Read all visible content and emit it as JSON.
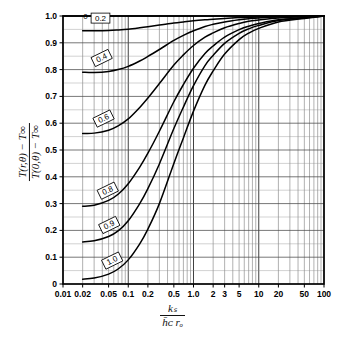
{
  "figure": {
    "title": "",
    "axis_y_label_numerator": "T(r,θ) − T∞",
    "axis_y_label_denominator": "T(0,θ) − T∞",
    "axis_x_label_numerator": "kₛ",
    "axis_x_label_denominator": "h̄ᴄ rₒ"
  },
  "chart_data": {
    "type": "line",
    "title": "",
    "xlabel": "k_s / (h_c r_o)",
    "ylabel": "(T(r,θ) - T∞) / (T(0,θ) - T∞)",
    "xscale": "log",
    "yscale": "linear",
    "xlim": [
      0.01,
      100
    ],
    "ylim": [
      0,
      1.0
    ],
    "grid": true,
    "legend": "inline-curve-labels",
    "x_ticks": [
      {
        "value": 0.01,
        "label": "0.01"
      },
      {
        "value": 0.02,
        "label": "0.02"
      },
      {
        "value": 0.05,
        "label": "0.05"
      },
      {
        "value": 0.1,
        "label": "0.1"
      },
      {
        "value": 0.2,
        "label": "0.2"
      },
      {
        "value": 0.5,
        "label": "0.5"
      },
      {
        "value": 1.0,
        "label": "1.0"
      },
      {
        "value": 2,
        "label": "2"
      },
      {
        "value": 3,
        "label": "3"
      },
      {
        "value": 5,
        "label": "5"
      },
      {
        "value": 10,
        "label": "10"
      },
      {
        "value": 20,
        "label": "20"
      },
      {
        "value": 50,
        "label": "50"
      },
      {
        "value": 100,
        "label": "100"
      }
    ],
    "y_ticks": [
      {
        "value": 0.0,
        "label": "0"
      },
      {
        "value": 0.1,
        "label": "0.1"
      },
      {
        "value": 0.2,
        "label": "0.2"
      },
      {
        "value": 0.3,
        "label": "0.3"
      },
      {
        "value": 0.4,
        "label": "0.4"
      },
      {
        "value": 0.5,
        "label": "0.5"
      },
      {
        "value": 0.6,
        "label": "0.6"
      },
      {
        "value": 0.7,
        "label": "0.7"
      },
      {
        "value": 0.8,
        "label": "0.8"
      },
      {
        "value": 0.9,
        "label": "0.9"
      },
      {
        "value": 1.0,
        "label": "1.0"
      }
    ],
    "series": [
      {
        "name": "0",
        "label": "0",
        "label_x": 0.0205,
        "label_y": 1.035,
        "x": [
          0.01,
          0.02,
          0.05,
          0.1,
          0.2,
          0.5,
          1.0,
          2,
          5,
          10,
          20,
          50,
          100
        ],
        "values": [
          1.0,
          1.0,
          1.0,
          1.0,
          1.0,
          1.0,
          1.0,
          1.0,
          1.0,
          1.0,
          1.0,
          1.0,
          1.0
        ]
      },
      {
        "name": "0.2",
        "label": "0.2",
        "label_x": 0.027,
        "label_y": 0.992,
        "x": [
          0.02,
          0.03,
          0.05,
          0.07,
          0.1,
          0.15,
          0.2,
          0.3,
          0.5,
          0.7,
          1.0,
          1.5,
          2,
          3,
          5,
          7,
          10,
          20,
          50,
          100
        ],
        "values": [
          0.945,
          0.945,
          0.946,
          0.948,
          0.951,
          0.956,
          0.96,
          0.966,
          0.974,
          0.978,
          0.982,
          0.986,
          0.988,
          0.991,
          0.994,
          0.995,
          0.996,
          0.998,
          0.999,
          1.0
        ]
      },
      {
        "name": "0.4",
        "label": "0.4",
        "label_x": 0.029,
        "label_y": 0.828,
        "x": [
          0.02,
          0.03,
          0.05,
          0.07,
          0.1,
          0.15,
          0.2,
          0.3,
          0.5,
          0.7,
          1.0,
          1.5,
          2,
          3,
          5,
          7,
          10,
          20,
          50,
          100
        ],
        "values": [
          0.79,
          0.789,
          0.793,
          0.8,
          0.812,
          0.832,
          0.849,
          0.875,
          0.909,
          0.928,
          0.945,
          0.961,
          0.969,
          0.978,
          0.986,
          0.99,
          0.993,
          0.996,
          0.998,
          1.0
        ]
      },
      {
        "name": "0.6",
        "label": "0.6",
        "label_x": 0.031,
        "label_y": 0.602,
        "x": [
          0.02,
          0.03,
          0.05,
          0.07,
          0.1,
          0.15,
          0.2,
          0.3,
          0.5,
          0.7,
          1.0,
          1.5,
          2,
          3,
          5,
          7,
          10,
          20,
          50,
          100
        ],
        "values": [
          0.562,
          0.563,
          0.574,
          0.59,
          0.616,
          0.659,
          0.694,
          0.748,
          0.817,
          0.855,
          0.89,
          0.921,
          0.937,
          0.956,
          0.972,
          0.98,
          0.985,
          0.993,
          0.997,
          1.0
        ]
      },
      {
        "name": "0.8",
        "label": "0.8",
        "label_x": 0.036,
        "label_y": 0.333,
        "x": [
          0.02,
          0.03,
          0.05,
          0.07,
          0.1,
          0.15,
          0.2,
          0.3,
          0.5,
          0.7,
          1.0,
          1.5,
          2,
          3,
          5,
          7,
          10,
          20,
          50,
          100
        ],
        "values": [
          0.29,
          0.294,
          0.312,
          0.335,
          0.374,
          0.436,
          0.488,
          0.57,
          0.68,
          0.744,
          0.805,
          0.86,
          0.888,
          0.921,
          0.949,
          0.962,
          0.972,
          0.986,
          0.994,
          1.0
        ]
      },
      {
        "name": "0.9",
        "label": "0.9",
        "label_x": 0.038,
        "label_y": 0.205,
        "x": [
          0.02,
          0.03,
          0.05,
          0.07,
          0.1,
          0.15,
          0.2,
          0.3,
          0.5,
          0.7,
          1.0,
          1.5,
          2,
          3,
          5,
          7,
          10,
          20,
          50,
          100
        ],
        "values": [
          0.157,
          0.161,
          0.177,
          0.198,
          0.236,
          0.3,
          0.356,
          0.448,
          0.58,
          0.66,
          0.74,
          0.815,
          0.853,
          0.898,
          0.935,
          0.952,
          0.965,
          0.983,
          0.993,
          1.0
        ]
      },
      {
        "name": "1.0",
        "label": "1.0",
        "label_x": 0.042,
        "label_y": 0.072,
        "x": [
          0.02,
          0.03,
          0.05,
          0.07,
          0.1,
          0.15,
          0.2,
          0.3,
          0.5,
          0.7,
          1.0,
          1.5,
          2,
          3,
          5,
          7,
          10,
          20,
          50,
          100
        ],
        "values": [
          0.018,
          0.022,
          0.037,
          0.056,
          0.09,
          0.15,
          0.205,
          0.3,
          0.45,
          0.545,
          0.645,
          0.742,
          0.795,
          0.858,
          0.912,
          0.936,
          0.954,
          0.978,
          0.991,
          1.0
        ]
      }
    ]
  }
}
